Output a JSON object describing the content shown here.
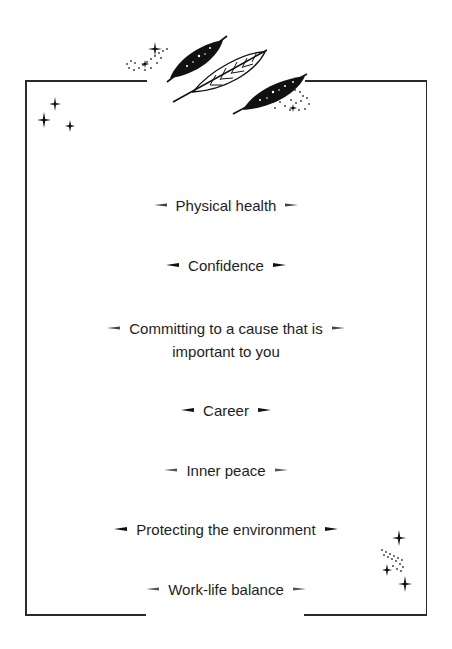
{
  "items": [
    {
      "label": "Physical health",
      "top": 192
    },
    {
      "label": "Confidence",
      "top": 252
    },
    {
      "label": "Committing to a cause that is",
      "label2": "important to you",
      "top": 315
    },
    {
      "label": "Career",
      "top": 397
    },
    {
      "label": "Inner peace",
      "top": 457
    },
    {
      "label": "Protecting the environment",
      "top": 516
    },
    {
      "label": "Work-life balance",
      "top": 576
    }
  ],
  "decorations": {
    "top": "feathers-ornament",
    "top_left": "sparkles",
    "bottom_right": "sparkles-with-dots"
  },
  "colors": {
    "ink": "#1e1e1e",
    "background": "#ffffff"
  }
}
